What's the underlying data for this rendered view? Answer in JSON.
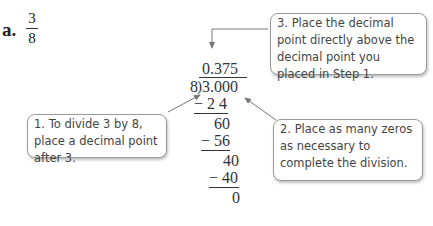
{
  "problem": {
    "label": "a.",
    "fraction": {
      "numerator": "3",
      "denominator": "8"
    }
  },
  "long_division": {
    "quotient": "0.375",
    "divisor": "8",
    "dividend": "3.000",
    "steps": [
      {
        "text": "− 2 4",
        "underline": true
      },
      {
        "text": "60",
        "underline": false
      },
      {
        "text": "− 56",
        "underline": true
      },
      {
        "text": "40",
        "underline": false
      },
      {
        "text": "− 40",
        "underline": true
      },
      {
        "text": "0",
        "underline": false
      }
    ]
  },
  "callouts": [
    {
      "id": "step1",
      "text": "1.  To divide 3 by 8, place a decimal point after 3."
    },
    {
      "id": "step2",
      "text": "2.  Place as many zeros as necessary to complete the division."
    },
    {
      "id": "step3",
      "text": "3.  Place the decimal point directly above the decimal point you placed in Step 1."
    }
  ],
  "colors": {
    "arrow": "#777777",
    "callout_border": "#9a9a9a",
    "text": "#333333"
  }
}
